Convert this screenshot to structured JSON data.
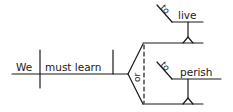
{
  "diagram": {
    "type": "sentence-diagram",
    "sentence": "We must learn to live or perish",
    "subject": "We",
    "verb": "must learn",
    "conjunction": "or",
    "compound_object": [
      {
        "marker": "to",
        "word": "live"
      },
      {
        "marker": "to",
        "word": "perish"
      }
    ],
    "stroke_color": "#1a1a1a",
    "background": "#ffffff"
  }
}
